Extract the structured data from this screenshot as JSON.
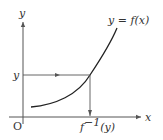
{
  "diagram": {
    "labels": {
      "y_axis": "y",
      "x_axis": "x",
      "origin": "O",
      "y_value": "y",
      "curve": "y = f(x)",
      "inverse_prefix": "f",
      "inverse_exp": "−1",
      "inverse_suffix": "(y)"
    },
    "colors": {
      "axis": "#555555",
      "curve": "#222222",
      "text": "#333333"
    }
  }
}
